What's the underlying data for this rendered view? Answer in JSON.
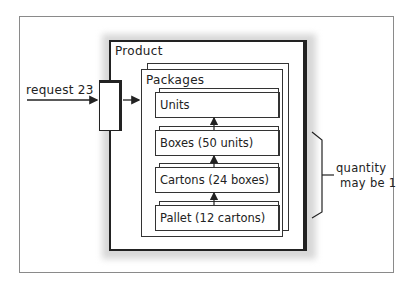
{
  "diagram": {
    "product": {
      "label": "Product"
    },
    "packages": {
      "label": "Packages"
    },
    "input_arrow": {
      "label": "request 23"
    },
    "levels": [
      {
        "label": "Units"
      },
      {
        "label": "Boxes (50 units)"
      },
      {
        "label": "Cartons (24 boxes)"
      },
      {
        "label": "Pallet (12 cartons)"
      }
    ],
    "bracket_note": {
      "line1": "quantity",
      "line2": "may be 1"
    }
  }
}
